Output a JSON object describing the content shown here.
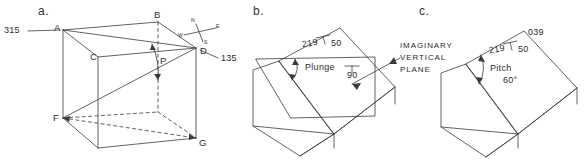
{
  "figure": {
    "title_visible": false,
    "panels": [
      {
        "tag": "a.",
        "description": "cube with inclined plane A-B-D-F and angle P",
        "labels": {
          "bearing_left": "315",
          "bearing_right": "135",
          "vertex_a": "A",
          "vertex_b": "B",
          "vertex_c": "C",
          "vertex_d": "D",
          "vertex_f": "F",
          "vertex_g": "G",
          "angle_p": "P"
        },
        "compass": {
          "n": "N",
          "e": "E",
          "s": "S",
          "w": "W"
        }
      },
      {
        "tag": "b.",
        "description": "block with inclined plane, plunge angle and imaginary vertical plane",
        "labels": {
          "strike": "219",
          "dip": "50",
          "plunge": "Plunge",
          "vertical_dip": "90",
          "caption_line1": "IMAGINARY",
          "caption_line2": "VERTICAL",
          "caption_line3": "PLANE"
        }
      },
      {
        "tag": "c.",
        "description": "block with inclined plane showing pitch measured in the plane",
        "labels": {
          "bearing": "039",
          "strike": "219",
          "dip": "50",
          "pitch": "Pitch",
          "pitch_value": "60°"
        }
      }
    ]
  },
  "style": {
    "line_color": "#3a3a3a",
    "text_color": "#2b2b2b",
    "background": "#ffffff"
  }
}
